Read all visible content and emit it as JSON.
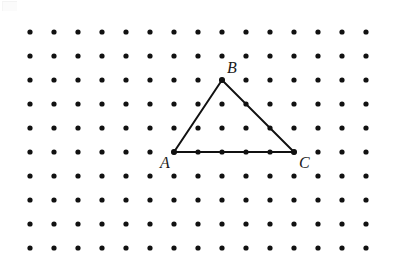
{
  "figure": {
    "type": "dot-lattice-triangle",
    "background_color": "#ffffff",
    "canvas": {
      "width": 399,
      "height": 275
    },
    "lattice": {
      "name": "square-dot-grid",
      "columns": 15,
      "rows": 10,
      "origin_x": 30,
      "origin_y": 32,
      "spacing_x": 24,
      "spacing_y": 24,
      "dot_radius": 2.6,
      "dot_color": "#111111"
    },
    "shape": {
      "name": "triangle",
      "stroke_color": "#111111",
      "stroke_width": 2,
      "fill": "none",
      "vertices": [
        {
          "label": "A",
          "grid_col": 6,
          "grid_row": 5,
          "x": 174,
          "y": 152
        },
        {
          "label": "B",
          "grid_col": 8,
          "grid_row": 2,
          "x": 222,
          "y": 80
        },
        {
          "label": "C",
          "grid_col": 11,
          "grid_row": 5,
          "x": 294,
          "y": 152
        }
      ],
      "edges": [
        {
          "name": "AB",
          "from": "A",
          "to": "B"
        },
        {
          "name": "BC",
          "from": "B",
          "to": "C"
        },
        {
          "name": "CA",
          "from": "C",
          "to": "A"
        }
      ]
    },
    "labels": [
      {
        "id": "A",
        "text": "A",
        "x": 160,
        "y": 155
      },
      {
        "id": "B",
        "text": "B",
        "x": 227,
        "y": 60
      },
      {
        "id": "C",
        "text": "C",
        "x": 299,
        "y": 155
      }
    ]
  }
}
